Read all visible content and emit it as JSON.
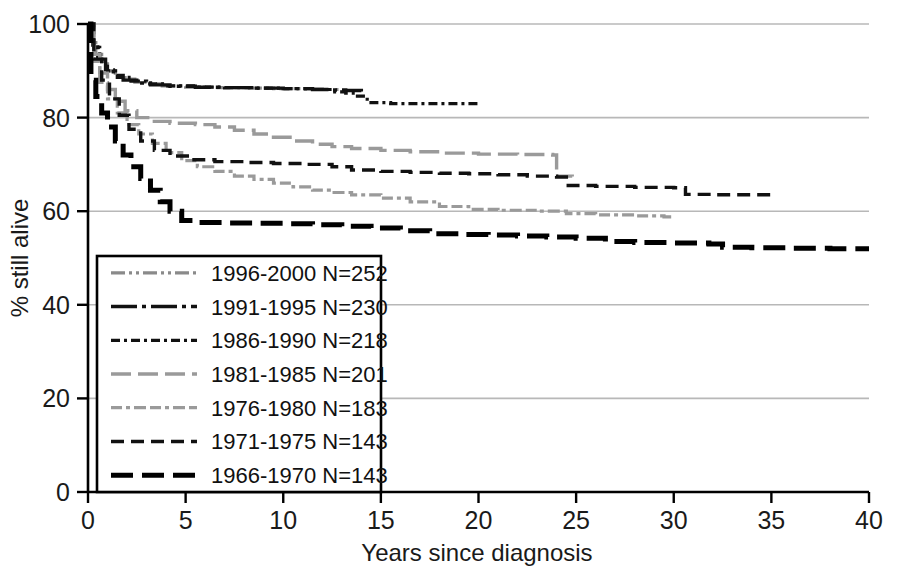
{
  "chart_data": {
    "type": "line",
    "title": "",
    "xlabel": "Years since diagnosis",
    "ylabel": "% still alive",
    "xlim": [
      0,
      40
    ],
    "ylim": [
      0,
      100
    ],
    "xticks": [
      "0",
      "5",
      "10",
      "15",
      "20",
      "25",
      "30",
      "35",
      "40"
    ],
    "xtick_values": [
      0,
      5,
      10,
      15,
      20,
      25,
      30,
      35,
      40
    ],
    "yticks": [
      "0",
      "20",
      "40",
      "60",
      "80",
      "100"
    ],
    "ytick_values": [
      0,
      20,
      40,
      60,
      80,
      100
    ],
    "grid": "horizontal",
    "legend_position": "lower-left",
    "series": [
      {
        "name": "1996-2000 N=252",
        "label": "1996-2000 N=252",
        "cohort": "1996-2000",
        "n": 252,
        "color": "#8a8a8a",
        "dash": "14,4,3,4,3,4",
        "width": 3.2,
        "points": [
          [
            0,
            100
          ],
          [
            0.2,
            96
          ],
          [
            0.4,
            93.5
          ],
          [
            0.7,
            91.5
          ],
          [
            1.0,
            90.0
          ],
          [
            1.4,
            89.0
          ],
          [
            1.9,
            88.2
          ],
          [
            2.4,
            87.6
          ],
          [
            3.0,
            87.2
          ],
          [
            3.8,
            86.8
          ],
          [
            5.0,
            86.5
          ],
          [
            6.5,
            86.4
          ],
          [
            8.0,
            86.3
          ],
          [
            9.5,
            86.2
          ],
          [
            11.0,
            86.1
          ],
          [
            12.0,
            86.0
          ],
          [
            13.0,
            85.8
          ]
        ]
      },
      {
        "name": "1991-1995 N=230",
        "label": "1991-1995 N=230",
        "cohort": "1991-1995",
        "n": 230,
        "color": "#111111",
        "dash": "26,5,4,5",
        "width": 3.4,
        "points": [
          [
            0,
            100
          ],
          [
            0.25,
            95.5
          ],
          [
            0.5,
            92.5
          ],
          [
            0.9,
            90.2
          ],
          [
            1.3,
            89.0
          ],
          [
            1.8,
            88.0
          ],
          [
            2.5,
            87.4
          ],
          [
            3.2,
            87.0
          ],
          [
            4.2,
            86.7
          ],
          [
            5.5,
            86.5
          ],
          [
            7.0,
            86.4
          ],
          [
            8.5,
            86.3
          ],
          [
            10.0,
            86.2
          ],
          [
            11.5,
            86.0
          ],
          [
            12.4,
            85.9
          ],
          [
            13.2,
            85.8
          ],
          [
            14.0,
            85.6
          ]
        ]
      },
      {
        "name": "1986-1990 N=218",
        "label": "1986-1990 N=218",
        "cohort": "1986-1990",
        "n": 218,
        "color": "#111111",
        "dash": "9,4,3,4",
        "width": 3.2,
        "points": [
          [
            0,
            100
          ],
          [
            0.3,
            95.0
          ],
          [
            0.6,
            92.0
          ],
          [
            1.0,
            90.0
          ],
          [
            1.5,
            88.6
          ],
          [
            2.2,
            87.8
          ],
          [
            3.0,
            87.2
          ],
          [
            4.0,
            86.8
          ],
          [
            5.5,
            86.5
          ],
          [
            7.0,
            86.4
          ],
          [
            8.5,
            86.3
          ],
          [
            10.0,
            86.2
          ],
          [
            11.5,
            86.0
          ],
          [
            12.5,
            85.5
          ],
          [
            13.2,
            85.2
          ],
          [
            13.8,
            84.6
          ],
          [
            14.3,
            83.2
          ],
          [
            15.5,
            83.0
          ],
          [
            17.0,
            83.0
          ],
          [
            20.0,
            83.0
          ]
        ]
      },
      {
        "name": "1981-1985 N=201",
        "label": "1981-1985 N=201",
        "cohort": "1981-1985",
        "n": 201,
        "color": "#9a9a9a",
        "dash": "20,7",
        "width": 3.4,
        "points": [
          [
            0,
            100
          ],
          [
            0.3,
            93.5
          ],
          [
            0.6,
            89.5
          ],
          [
            1.0,
            86.0
          ],
          [
            1.4,
            83.5
          ],
          [
            1.9,
            81.5
          ],
          [
            2.5,
            80.0
          ],
          [
            3.2,
            79.2
          ],
          [
            4.2,
            78.8
          ],
          [
            5.5,
            78.5
          ],
          [
            6.5,
            78.0
          ],
          [
            7.5,
            77.3
          ],
          [
            8.5,
            76.5
          ],
          [
            9.5,
            75.8
          ],
          [
            10.5,
            75.0
          ],
          [
            11.5,
            74.3
          ],
          [
            12.5,
            73.8
          ],
          [
            13.5,
            73.4
          ],
          [
            15.0,
            73.0
          ],
          [
            16.5,
            72.7
          ],
          [
            18.0,
            72.4
          ],
          [
            20.0,
            72.2
          ],
          [
            22.0,
            72.1
          ],
          [
            23.8,
            72.0
          ],
          [
            24.0,
            67.5
          ],
          [
            24.8,
            67.4
          ]
        ]
      },
      {
        "name": "1976-1980 N=183",
        "label": "1976-1980 N=183",
        "cohort": "1976-1980",
        "n": 183,
        "color": "#9a9a9a",
        "dash": "11,4,4,4,12,4",
        "width": 3.2,
        "points": [
          [
            0,
            100
          ],
          [
            0.3,
            92.0
          ],
          [
            0.6,
            87.5
          ],
          [
            1.0,
            84.0
          ],
          [
            1.5,
            81.0
          ],
          [
            2.0,
            78.5
          ],
          [
            2.6,
            76.5
          ],
          [
            3.3,
            74.5
          ],
          [
            4.0,
            72.5
          ],
          [
            4.8,
            70.8
          ],
          [
            5.6,
            69.5
          ],
          [
            6.5,
            68.5
          ],
          [
            7.5,
            67.5
          ],
          [
            8.5,
            66.8
          ],
          [
            9.5,
            66.0
          ],
          [
            10.5,
            65.2
          ],
          [
            11.5,
            64.5
          ],
          [
            12.5,
            64.0
          ],
          [
            13.5,
            63.5
          ],
          [
            15.0,
            62.8
          ],
          [
            16.5,
            62.0
          ],
          [
            18.0,
            61.0
          ],
          [
            19.5,
            60.4
          ],
          [
            21.0,
            60.2
          ],
          [
            23.0,
            60.0
          ],
          [
            24.5,
            59.5
          ],
          [
            26.0,
            59.2
          ],
          [
            28.0,
            59.0
          ],
          [
            29.5,
            58.8
          ],
          [
            30.0,
            58.7
          ]
        ]
      },
      {
        "name": "1971-1975 N=143",
        "label": "1971-1975 N=143",
        "cohort": "1971-1975",
        "n": 143,
        "color": "#111111",
        "dash": "13,7",
        "width": 3.4,
        "points": [
          [
            0,
            100
          ],
          [
            0.3,
            92.5
          ],
          [
            0.7,
            88.0
          ],
          [
            1.1,
            84.0
          ],
          [
            1.6,
            80.5
          ],
          [
            2.1,
            77.5
          ],
          [
            2.7,
            75.0
          ],
          [
            3.4,
            73.0
          ],
          [
            4.2,
            71.8
          ],
          [
            5.2,
            71.0
          ],
          [
            6.5,
            70.6
          ],
          [
            8.0,
            70.4
          ],
          [
            9.5,
            70.2
          ],
          [
            11.0,
            70.0
          ],
          [
            12.5,
            69.5
          ],
          [
            13.5,
            68.8
          ],
          [
            15.0,
            68.5
          ],
          [
            16.5,
            68.3
          ],
          [
            18.0,
            68.1
          ],
          [
            19.5,
            68.0
          ],
          [
            21.0,
            67.8
          ],
          [
            22.5,
            67.5
          ],
          [
            24.0,
            67.3
          ],
          [
            24.5,
            65.5
          ],
          [
            26.0,
            65.3
          ],
          [
            28.0,
            65.1
          ],
          [
            30.0,
            65.0
          ],
          [
            30.6,
            63.6
          ],
          [
            32.0,
            63.5
          ],
          [
            34.0,
            63.5
          ],
          [
            35.0,
            63.5
          ]
        ]
      },
      {
        "name": "1966-1970 N=143",
        "label": "1966-1970 N=143",
        "cohort": "1966-1970",
        "n": 143,
        "color": "#000000",
        "dash": "22,9",
        "width": 5.0,
        "points": [
          [
            0,
            100
          ],
          [
            0.15,
            88.0
          ],
          [
            0.4,
            84.5
          ],
          [
            0.7,
            81.0
          ],
          [
            1.0,
            78.0
          ],
          [
            1.4,
            75.0
          ],
          [
            1.8,
            72.0
          ],
          [
            2.2,
            69.5
          ],
          [
            2.7,
            67.0
          ],
          [
            3.2,
            64.5
          ],
          [
            3.7,
            62.0
          ],
          [
            4.2,
            60.0
          ],
          [
            4.8,
            58.0
          ],
          [
            5.5,
            57.6
          ],
          [
            7.0,
            57.5
          ],
          [
            8.5,
            57.4
          ],
          [
            10.0,
            57.3
          ],
          [
            11.5,
            57.1
          ],
          [
            13.0,
            56.8
          ],
          [
            14.5,
            56.4
          ],
          [
            16.0,
            55.8
          ],
          [
            17.5,
            55.2
          ],
          [
            19.0,
            55.0
          ],
          [
            20.5,
            54.9
          ],
          [
            22.0,
            54.7
          ],
          [
            23.5,
            54.5
          ],
          [
            25.0,
            54.2
          ],
          [
            26.5,
            53.5
          ],
          [
            28.0,
            53.3
          ],
          [
            30.0,
            53.2
          ],
          [
            31.8,
            53.0
          ],
          [
            32.5,
            52.3
          ],
          [
            34.0,
            52.2
          ],
          [
            36.0,
            52.1
          ],
          [
            38.0,
            52.0
          ],
          [
            40.0,
            52.0
          ]
        ]
      }
    ]
  },
  "axes": {
    "xlabel": "Years since diagnosis",
    "ylabel": "% still alive"
  }
}
